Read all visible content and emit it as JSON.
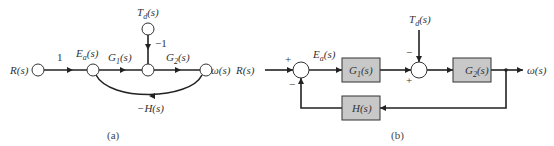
{
  "figure": {
    "panel_a": {
      "caption": "(a)",
      "type": "signal-flow graph",
      "nodes": {
        "input": "R(s)",
        "error": "E",
        "error_sub": "a",
        "error_tail": "(s)",
        "disturbance": "T",
        "disturbance_sub": "d",
        "disturbance_tail": "(s)",
        "output": "ω(s)"
      },
      "branches": {
        "r_to_e": "1",
        "g1_main": "G",
        "g1_sub": "1",
        "g1_tail": "(s)",
        "g2_main": "G",
        "g2_sub": "2",
        "g2_tail": "(s)",
        "td_gain": "−1",
        "feedback": "−H(s)"
      }
    },
    "panel_b": {
      "caption": "(b)",
      "type": "block diagram",
      "input": "R(s)",
      "output": "ω(s)",
      "error_main": "E",
      "error_sub": "a",
      "error_tail": "(s)",
      "disturbance_main": "T",
      "disturbance_sub": "d",
      "disturbance_tail": "(s)",
      "blocks": {
        "g1_main": "G",
        "g1_sub": "1",
        "g1_tail": "(s)",
        "g2_main": "G",
        "g2_sub": "2",
        "g2_tail": "(s)",
        "h": "H(s)"
      },
      "summer1_signs": {
        "top": "+",
        "bottom": "−"
      },
      "summer2_signs": {
        "top": "−",
        "bottom": "+"
      }
    },
    "colors": {
      "line": "#222222",
      "block_fill": "#c8c8c8",
      "node_fill": "#ffffff"
    }
  }
}
